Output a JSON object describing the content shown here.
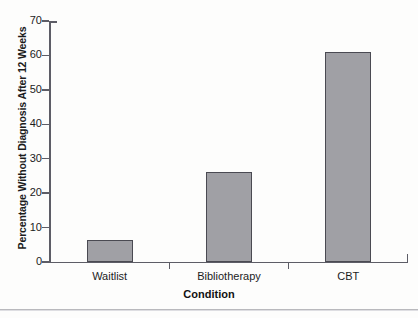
{
  "chart_data": {
    "type": "bar",
    "title": "",
    "xlabel": "Condition",
    "ylabel": "Percentage Without Diagnosis After 12 Weeks",
    "categories": [
      "Waitlist",
      "Bibliotherapy",
      "CBT"
    ],
    "values": [
      6.5,
      26,
      61
    ],
    "ylim": [
      0,
      70
    ],
    "yticks": [
      0,
      10,
      20,
      30,
      40,
      50,
      60,
      70
    ],
    "ytick_labels": [
      "0",
      "10",
      "20",
      "30",
      "40",
      "50",
      "60",
      "70"
    ],
    "grid": false,
    "legend": null,
    "bar_color": "#a0a0a5",
    "bar_edge_color": "#4a4a52",
    "axis_color": "#5d5d66"
  },
  "axes": {
    "y_title": "Percentage Without Diagnosis After 12 Weeks",
    "x_title": "Condition"
  },
  "ticks": {
    "y": [
      {
        "label": "70",
        "value": 70
      },
      {
        "label": "60",
        "value": 60
      },
      {
        "label": "50",
        "value": 50
      },
      {
        "label": "40",
        "value": 40
      },
      {
        "label": "30",
        "value": 30
      },
      {
        "label": "20",
        "value": 20
      },
      {
        "label": "10",
        "value": 10
      },
      {
        "label": "0",
        "value": 0
      }
    ]
  },
  "bars": [
    {
      "label": "Waitlist",
      "value": 6.5
    },
    {
      "label": "Bibliotherapy",
      "value": 26
    },
    {
      "label": "CBT",
      "value": 61
    }
  ]
}
